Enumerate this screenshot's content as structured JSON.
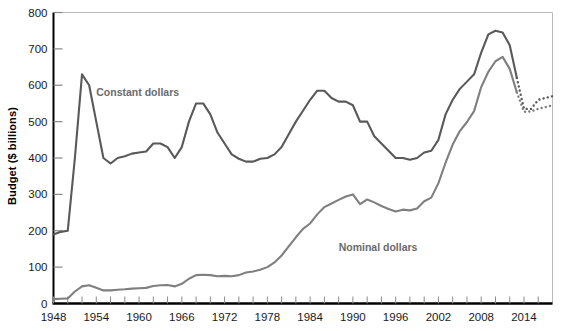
{
  "chart_data": {
    "type": "line",
    "title": "",
    "subtitle": "",
    "xlabel": "",
    "ylabel": "Budget ($ billions)",
    "xlim": [
      1948,
      2018
    ],
    "ylim": [
      0,
      800
    ],
    "x_tick_labels": [
      "1948",
      "1954",
      "1960",
      "1966",
      "1972",
      "1978",
      "1984",
      "1990",
      "1996",
      "2002",
      "2008",
      "2014"
    ],
    "x_tick_values": [
      1948,
      1954,
      1960,
      1966,
      1972,
      1978,
      1984,
      1990,
      1996,
      2002,
      2008,
      2014
    ],
    "y_tick_labels": [
      "0",
      "100",
      "200",
      "300",
      "400",
      "500",
      "600",
      "700",
      "800"
    ],
    "y_tick_values": [
      0,
      100,
      200,
      300,
      400,
      500,
      600,
      700,
      800
    ],
    "grid": false,
    "legend_position": "inline-annotation",
    "line_color": "#595959",
    "axis_color": "#000000",
    "annotations": [
      {
        "name": "constant-dollars-label",
        "text": "Constant dollars",
        "x": 1954.0,
        "y": 570
      },
      {
        "name": "nominal-dollars-label",
        "text": "Nominal dollars",
        "x": 1988.0,
        "y": 145
      }
    ],
    "series": [
      {
        "name": "Constant dollars",
        "color": "#595959",
        "style": "solid",
        "x": [
          1948,
          1949,
          1950,
          1951,
          1952,
          1953,
          1954,
          1955,
          1956,
          1957,
          1958,
          1959,
          1960,
          1961,
          1962,
          1963,
          1964,
          1965,
          1966,
          1967,
          1968,
          1969,
          1970,
          1971,
          1972,
          1973,
          1974,
          1975,
          1976,
          1977,
          1978,
          1979,
          1980,
          1981,
          1982,
          1983,
          1984,
          1985,
          1986,
          1987,
          1988,
          1989,
          1990,
          1991,
          1992,
          1993,
          1994,
          1995,
          1996,
          1997,
          1998,
          1999,
          2000,
          2001,
          2002,
          2003,
          2004,
          2005,
          2006,
          2007,
          2008,
          2009,
          2010,
          2011,
          2012,
          2013
        ],
        "values": [
          190,
          197,
          200,
          400,
          630,
          600,
          500,
          400,
          385,
          400,
          405,
          412,
          415,
          418,
          440,
          440,
          430,
          400,
          430,
          500,
          550,
          550,
          520,
          470,
          440,
          410,
          398,
          390,
          390,
          398,
          400,
          410,
          430,
          465,
          500,
          530,
          560,
          585,
          585,
          565,
          555,
          555,
          545,
          500,
          500,
          460,
          440,
          420,
          400,
          400,
          395,
          400,
          415,
          420,
          450,
          520,
          560,
          590,
          610,
          630,
          690,
          740,
          750,
          745,
          710,
          620
        ]
      },
      {
        "name": "Constant dollars (projected)",
        "color": "#595959",
        "style": "dotted",
        "x": [
          2013,
          2014,
          2015,
          2016,
          2017,
          2018
        ],
        "values": [
          620,
          535,
          535,
          560,
          565,
          570
        ]
      },
      {
        "name": "Nominal dollars",
        "color": "#7f7f7f",
        "style": "solid",
        "x": [
          1948,
          1949,
          1950,
          1951,
          1952,
          1953,
          1954,
          1955,
          1956,
          1957,
          1958,
          1959,
          1960,
          1961,
          1962,
          1963,
          1964,
          1965,
          1966,
          1967,
          1968,
          1969,
          1970,
          1971,
          1972,
          1973,
          1974,
          1975,
          1976,
          1977,
          1978,
          1979,
          1980,
          1981,
          1982,
          1983,
          1984,
          1985,
          1986,
          1987,
          1988,
          1989,
          1990,
          1991,
          1992,
          1993,
          1994,
          1995,
          1996,
          1997,
          1998,
          1999,
          2000,
          2001,
          2002,
          2003,
          2004,
          2005,
          2006,
          2007,
          2008,
          2009,
          2010,
          2011,
          2012,
          2013
        ],
        "values": [
          12,
          13,
          14,
          33,
          47,
          50,
          43,
          36,
          36,
          38,
          39,
          41,
          42,
          43,
          48,
          50,
          51,
          47,
          54,
          68,
          78,
          79,
          78,
          75,
          76,
          75,
          78,
          85,
          88,
          93,
          100,
          113,
          132,
          157,
          182,
          205,
          220,
          245,
          265,
          275,
          285,
          294,
          300,
          273,
          286,
          278,
          268,
          260,
          253,
          258,
          256,
          261,
          281,
          291,
          331,
          387,
          437,
          474,
          499,
          529,
          595,
          637,
          666,
          678,
          645,
          580
        ]
      },
      {
        "name": "Nominal dollars (projected)",
        "color": "#7f7f7f",
        "style": "dotted",
        "x": [
          2013,
          2014,
          2015,
          2016,
          2017,
          2018
        ],
        "values": [
          580,
          527,
          528,
          535,
          540,
          545
        ]
      }
    ]
  }
}
